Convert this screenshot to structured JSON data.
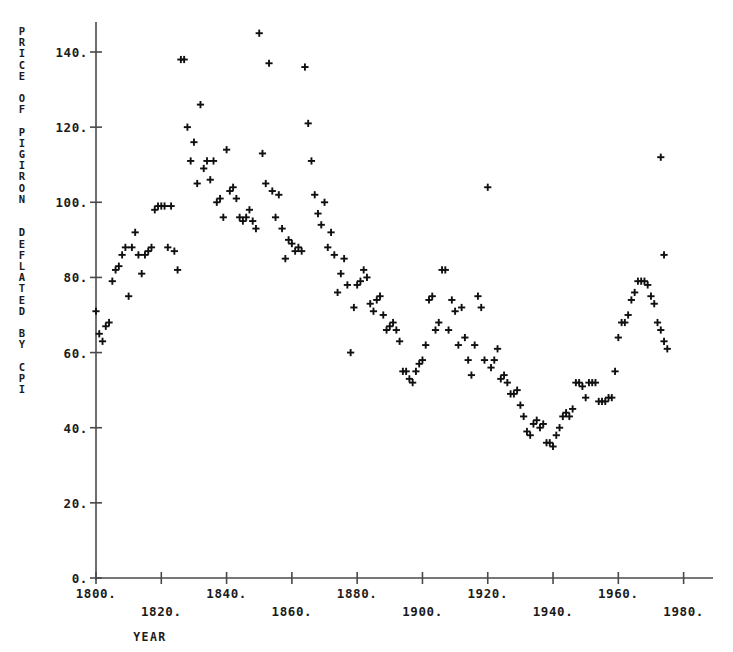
{
  "chart_data": {
    "type": "scatter",
    "title": "",
    "ylabel": "PRICE OF PIGIRON DEFLATED BY CPI",
    "ylabel_letters": [
      "P",
      "R",
      "I",
      "C",
      "E",
      "",
      "O",
      "F",
      "",
      "P",
      "I",
      "G",
      "I",
      "R",
      "O",
      "N",
      "",
      "",
      "D",
      "E",
      "F",
      "L",
      "A",
      "T",
      "E",
      "D",
      "",
      "B",
      "Y",
      "",
      "C",
      "P",
      "I"
    ],
    "xlabel": "YEAR",
    "xlim": [
      1800,
      1989
    ],
    "ylim": [
      0,
      148
    ],
    "grid": false,
    "legend": null,
    "marker": "+",
    "marker_color": "#101010",
    "axis_color": "#4a4a4a",
    "xticks": [
      1800,
      1820,
      1840,
      1860,
      1880,
      1900,
      1920,
      1940,
      1960,
      1980
    ],
    "xticklabels": [
      "1800.",
      "1820.",
      "1840.",
      "1860.",
      "1880.",
      "1900.",
      "1920.",
      "1940.",
      "1960.",
      "1980."
    ],
    "yticks": [
      0,
      20,
      40,
      60,
      80,
      100,
      120,
      140
    ],
    "yticklabels": [
      "0.",
      "20.",
      "40.",
      "60.",
      "80.",
      "100.",
      "120.",
      "140."
    ],
    "x": [
      1800,
      1801,
      1802,
      1803,
      1804,
      1805,
      1806,
      1807,
      1808,
      1809,
      1810,
      1811,
      1812,
      1813,
      1814,
      1815,
      1816,
      1817,
      1818,
      1819,
      1820,
      1821,
      1822,
      1823,
      1824,
      1825,
      1826,
      1827,
      1828,
      1829,
      1830,
      1831,
      1832,
      1833,
      1834,
      1835,
      1836,
      1837,
      1838,
      1839,
      1840,
      1841,
      1842,
      1843,
      1844,
      1845,
      1846,
      1847,
      1848,
      1849,
      1850,
      1851,
      1852,
      1853,
      1854,
      1855,
      1856,
      1857,
      1858,
      1859,
      1860,
      1861,
      1862,
      1863,
      1864,
      1865,
      1866,
      1867,
      1868,
      1869,
      1870,
      1871,
      1872,
      1873,
      1874,
      1875,
      1876,
      1877,
      1878,
      1879,
      1880,
      1881,
      1882,
      1883,
      1884,
      1885,
      1886,
      1887,
      1888,
      1889,
      1890,
      1891,
      1892,
      1893,
      1894,
      1895,
      1896,
      1897,
      1898,
      1899,
      1900,
      1901,
      1902,
      1903,
      1904,
      1905,
      1906,
      1907,
      1908,
      1909,
      1910,
      1911,
      1912,
      1913,
      1914,
      1915,
      1916,
      1917,
      1918,
      1919,
      1920,
      1921,
      1922,
      1923,
      1924,
      1925,
      1926,
      1927,
      1928,
      1929,
      1930,
      1931,
      1932,
      1933,
      1934,
      1935,
      1936,
      1937,
      1938,
      1939,
      1940,
      1941,
      1942,
      1943,
      1944,
      1945,
      1946,
      1947,
      1948,
      1949,
      1950,
      1951,
      1952,
      1953,
      1954,
      1955,
      1956,
      1957,
      1958,
      1959,
      1960,
      1961,
      1962,
      1963,
      1964,
      1965,
      1966,
      1967,
      1968,
      1969,
      1970,
      1971,
      1972,
      1973,
      1974,
      1975
    ],
    "y": [
      71,
      65,
      63,
      67,
      68,
      79,
      82,
      83,
      86,
      88,
      75,
      88,
      92,
      86,
      81,
      86,
      87,
      88,
      98,
      99,
      99,
      99,
      88,
      99,
      87,
      82,
      138,
      138,
      120,
      111,
      116,
      105,
      126,
      109,
      111,
      106,
      111,
      100,
      101,
      96,
      114,
      103,
      104,
      101,
      96,
      95,
      96,
      98,
      95,
      93,
      145,
      113,
      105,
      137,
      103,
      96,
      102,
      93,
      85,
      90,
      89,
      87,
      88,
      87,
      136,
      121,
      111,
      102,
      97,
      94,
      100,
      88,
      92,
      86,
      76,
      81,
      85,
      78,
      60,
      72,
      78,
      79,
      82,
      80,
      73,
      71,
      74,
      75,
      70,
      66,
      67,
      68,
      66,
      63,
      55,
      55,
      53,
      52,
      55,
      57,
      58,
      62,
      74,
      75,
      66,
      68,
      82,
      82,
      66,
      74,
      71,
      62,
      72,
      64,
      58,
      54,
      62,
      75,
      72,
      58,
      104,
      56,
      58,
      61,
      53,
      54,
      52,
      49,
      49,
      50,
      46,
      43,
      39,
      38,
      41,
      42,
      40,
      41,
      36,
      36,
      35,
      38,
      40,
      43,
      44,
      43,
      45,
      52,
      52,
      51,
      48,
      52,
      52,
      52,
      47,
      47,
      47,
      48,
      48,
      55,
      64,
      68,
      68,
      70,
      74,
      76,
      79,
      79,
      79,
      78,
      75,
      73,
      68,
      66,
      63,
      61
    ],
    "extra_points": [
      {
        "x": 1973,
        "y": 112
      },
      {
        "x": 1974,
        "y": 86
      }
    ]
  }
}
